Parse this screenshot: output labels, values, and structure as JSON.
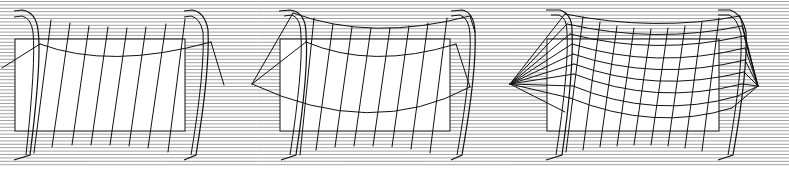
{
  "figure": {
    "width": 789,
    "height": 173,
    "background": "#ffffff",
    "stroke_color": "#111111",
    "hatch_color": "#8a8a8a",
    "hatch": {
      "spacing": 3.4,
      "y_start": 1.5,
      "y_end": 168
    }
  },
  "panels": [
    {
      "id": "panel-1",
      "label": "Panel 1: Flat sheet hung between posts, vertical slats only",
      "rect": {
        "x": 15,
        "y": 39,
        "w": 170,
        "h": 92
      },
      "posts": [
        {
          "d": "M14,11 L22,10 Q36,12 38,30 L38,30 Q42,60 30,155 L14,160",
          "inner": "M14,17 L22,16 Q31,18 33,32 Q36,62 26,155"
        },
        {
          "d": "M184,11 L192,10 Q205,12 208,30 Q210,70 196,155 L184,160",
          "inner": "M184,17 L191,16 Q200,18 203,32 Q205,70 191,155"
        }
      ],
      "curves": [
        {
          "d": "M40,44 Q110,70 211,42"
        }
      ],
      "guys": [
        {
          "d": "M40,44 L2,68"
        },
        {
          "d": "M211,42 L224,85"
        }
      ],
      "slats": [
        {
          "x1": 51,
          "y1": 20,
          "x2": 34,
          "y2": 153
        },
        {
          "x1": 70,
          "y1": 23,
          "x2": 52,
          "y2": 147
        },
        {
          "x1": 89,
          "y1": 26,
          "x2": 72,
          "y2": 145
        },
        {
          "x1": 108,
          "y1": 27,
          "x2": 91,
          "y2": 145
        },
        {
          "x1": 127,
          "y1": 28,
          "x2": 110,
          "y2": 145
        },
        {
          "x1": 146,
          "y1": 27,
          "x2": 129,
          "y2": 146
        },
        {
          "x1": 166,
          "y1": 24,
          "x2": 148,
          "y2": 148
        },
        {
          "x1": 185,
          "y1": 19,
          "x2": 168,
          "y2": 152
        }
      ]
    },
    {
      "id": "panel-2",
      "label": "Panel 2: Saddle-curved sheet with top edge arch and side tie-backs",
      "rect": {
        "x": 280,
        "y": 39,
        "w": 170,
        "h": 92
      },
      "posts": [
        {
          "d": "M279,11 L290,10 Q306,12 306,34 Q309,70 296,155 L281,160",
          "inner": "M284,16 L292,15 Q301,18 301,36 Q303,70 290,155"
        },
        {
          "d": "M451,11 L462,10 Q474,12 475,32 Q477,70 462,155 L451,160",
          "inner": "M451,16 L460,15 Q469,18 470,34 Q472,70 457,155"
        }
      ],
      "curves": [
        {
          "d": "M293,13 Q372,42 470,16"
        },
        {
          "d": "M306,42 Q372,70 456,44"
        },
        {
          "d": "M252,84 Q372,140 470,87"
        }
      ],
      "guys": [
        {
          "d": "M293,13 L252,84"
        },
        {
          "d": "M306,42 L252,84"
        },
        {
          "d": "M456,44 L470,87"
        },
        {
          "d": "M470,16 L475,32"
        }
      ],
      "slats": [
        {
          "x1": 314,
          "y1": 18,
          "x2": 300,
          "y2": 155
        },
        {
          "x1": 333,
          "y1": 24,
          "x2": 316,
          "y2": 150
        },
        {
          "x1": 352,
          "y1": 27,
          "x2": 335,
          "y2": 147
        },
        {
          "x1": 371,
          "y1": 28,
          "x2": 354,
          "y2": 146
        },
        {
          "x1": 390,
          "y1": 28,
          "x2": 373,
          "y2": 146
        },
        {
          "x1": 409,
          "y1": 26,
          "x2": 392,
          "y2": 147
        },
        {
          "x1": 428,
          "y1": 23,
          "x2": 411,
          "y2": 149
        },
        {
          "x1": 447,
          "y1": 18,
          "x2": 430,
          "y2": 153
        }
      ]
    },
    {
      "id": "panel-3",
      "label": "Panel 3: Fully meshed saddle surface with fan anchors",
      "rect": {
        "x": 547,
        "y": 39,
        "w": 172,
        "h": 92
      },
      "posts": [
        {
          "d": "M546,10 L560,10 Q572,14 572,30 Q574,70 562,155 L546,160",
          "inner": "M551,15 L559,15 Q567,18 567,32 Q569,70 556,155"
        },
        {
          "d": "M718,10 L730,10 Q742,14 746,32 Q748,70 733,155 L718,160",
          "inner": "M718,15 L729,15 Q737,18 741,34 Q743,70 728,155"
        }
      ],
      "fan_left": {
        "x": 510,
        "y": 84,
        "targets": [
          [
            565,
            14
          ],
          [
            567,
            24
          ],
          [
            570,
            34
          ],
          [
            572,
            44
          ],
          [
            573,
            54
          ],
          [
            574,
            64
          ],
          [
            574,
            74
          ],
          [
            573,
            86
          ],
          [
            570,
            98
          ],
          [
            565,
            112
          ]
        ]
      },
      "fan_right": {
        "x": 758,
        "y": 86,
        "targets": [
          [
            740,
            16
          ],
          [
            742,
            26
          ],
          [
            744,
            36
          ],
          [
            745,
            48
          ],
          [
            745,
            60
          ],
          [
            744,
            72
          ],
          [
            742,
            84
          ],
          [
            738,
            96
          ],
          [
            732,
            108
          ]
        ]
      },
      "mesh_rows": [
        {
          "d": "M565,14 Q655,32 740,16"
        },
        {
          "d": "M567,24 Q655,44 742,26"
        },
        {
          "d": "M570,34 Q655,56 744,36"
        },
        {
          "d": "M572,44 Q655,70 745,48"
        },
        {
          "d": "M573,54 Q655,82 745,60"
        },
        {
          "d": "M574,64 Q655,94 744,72"
        },
        {
          "d": "M574,74 Q655,106 742,84"
        },
        {
          "d": "M573,86 Q655,120 738,96"
        },
        {
          "d": "M570,98 Q655,132 732,108"
        }
      ],
      "slats": [
        {
          "x1": 583,
          "y1": 17,
          "x2": 566,
          "y2": 152
        },
        {
          "x1": 600,
          "y1": 22,
          "x2": 583,
          "y2": 150
        },
        {
          "x1": 617,
          "y1": 26,
          "x2": 600,
          "y2": 147
        },
        {
          "x1": 634,
          "y1": 28,
          "x2": 617,
          "y2": 146
        },
        {
          "x1": 651,
          "y1": 29,
          "x2": 634,
          "y2": 145
        },
        {
          "x1": 668,
          "y1": 28,
          "x2": 651,
          "y2": 145
        },
        {
          "x1": 685,
          "y1": 26,
          "x2": 668,
          "y2": 146
        },
        {
          "x1": 702,
          "y1": 22,
          "x2": 685,
          "y2": 148
        },
        {
          "x1": 719,
          "y1": 18,
          "x2": 702,
          "y2": 151
        }
      ]
    }
  ]
}
